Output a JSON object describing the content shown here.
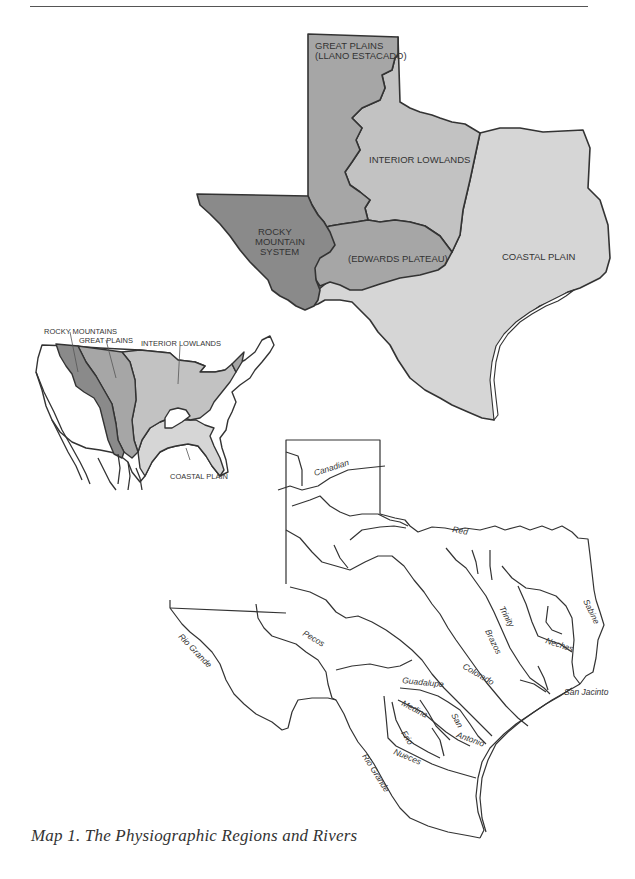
{
  "page": {
    "caption": "Map 1. The Physiographic Regions and Rivers"
  },
  "colors": {
    "rocky": "#8a8a8a",
    "great_plains": "#a6a6a6",
    "interior_lowlands": "#c2c2c2",
    "coastal_plain": "#d6d6d6",
    "outline": "#333333"
  },
  "texas_regions_map": {
    "regions": [
      {
        "id": "great-plains",
        "line1": "GREAT PLAINS",
        "line2": "(LLANO ESTACADO)"
      },
      {
        "id": "interior-lowlands",
        "label": "INTERIOR LOWLANDS"
      },
      {
        "id": "rocky-mountain-system",
        "line1": "ROCKY",
        "line2": "MOUNTAIN",
        "line3": "SYSTEM"
      },
      {
        "id": "edwards-plateau",
        "label": "(EDWARDS PLATEAU)"
      },
      {
        "id": "coastal-plain",
        "label": "COASTAL PLAIN"
      }
    ]
  },
  "us_inset_map": {
    "labels": {
      "rocky": "ROCKY MOUNTAINS",
      "great_plains": "GREAT PLAINS",
      "interior": "INTERIOR LOWLANDS",
      "coastal": "COASTAL PLAIN"
    }
  },
  "rivers_map": {
    "rivers": {
      "canadian": "Canadian",
      "red": "Red",
      "sabine": "Sabine",
      "trinity": "Trinity",
      "neches": "Neches",
      "brazos": "Brazos",
      "colorado": "Colorado",
      "guadalupe": "Guadalupe",
      "medina": "Medina",
      "san": "San",
      "antonio": "Antonio",
      "frio": "Frio",
      "nueces": "Nueces",
      "san_jacinto": "San Jacinto",
      "pecos": "Pecos",
      "rio_grande_upper": "Rio Grande",
      "rio_grande_lower": "Rio Grande"
    }
  }
}
